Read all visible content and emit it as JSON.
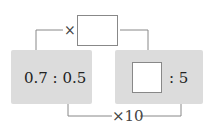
{
  "diagram": {
    "left_ratio": {
      "text": "0.7 : 0.5"
    },
    "right_ratio": {
      "colon_text": ": 5",
      "blank": ""
    },
    "top_operator": {
      "symbol": "×",
      "blank": ""
    },
    "bottom_operator": {
      "text": "×10"
    }
  },
  "colors": {
    "panel": "#dcdcdc",
    "line": "#777777",
    "text": "#222222"
  }
}
